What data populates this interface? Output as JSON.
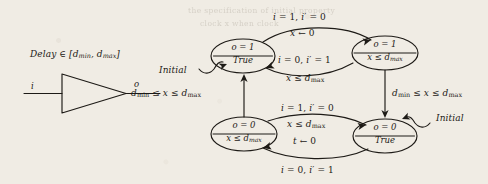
{
  "figure": {
    "background_color": "#f0ece4",
    "ink_color": "#1d1a16"
  },
  "gate": {
    "caption_prefix": "Delay",
    "caption_member": "∈",
    "caption_range": "[d",
    "caption_full": "Delay ∈ [dmin, dmax]",
    "delay_min": "min",
    "delay_max": "max",
    "input_label": "i",
    "output_label": "o",
    "symbol_name": "buffer-triangle"
  },
  "automaton": {
    "states": [
      {
        "id": "q1",
        "position": "top-left",
        "output_line": "o = 1",
        "invariant_line": "True",
        "is_initial": true,
        "initial_label": "Initial"
      },
      {
        "id": "q2",
        "position": "top-right",
        "output_line": "o = 1",
        "invariant_line": "x ≤ dmax",
        "invariant_base": "x ≤ d",
        "invariant_sub": "max",
        "is_initial": false,
        "initial_label": ""
      },
      {
        "id": "q3",
        "position": "bottom-left",
        "output_line": "o = 0",
        "invariant_line": "x ≤ dmax",
        "invariant_base": "x ≤ d",
        "invariant_sub": "max",
        "is_initial": false,
        "initial_label": ""
      },
      {
        "id": "q4",
        "position": "bottom-right",
        "output_line": "o = 0",
        "invariant_line": "True",
        "is_initial": true,
        "initial_label": "Initial"
      }
    ],
    "transitions": [
      {
        "id": "t-top",
        "from": "q1",
        "to": "q2",
        "guard": "i = 1, i′ = 0",
        "action": "x ← 0"
      },
      {
        "id": "t-top-back",
        "from": "q2",
        "to": "q1",
        "guard": "i = 0, i′ = 1",
        "action": "x ≤ dmax",
        "action_base": "x ≤ d",
        "action_sub": "max"
      },
      {
        "id": "t-bottom",
        "from": "q3",
        "to": "q4",
        "guard": "i = 1, i′ = 0",
        "action": "x ≤ dmax",
        "action_base": "x ≤ d",
        "action_sub": "max",
        "action2": "t ← 0"
      },
      {
        "id": "t-bottom-back",
        "from": "q4",
        "to": "q3",
        "guard": "i = 0, i′ = 1",
        "action": ""
      },
      {
        "id": "t-left-up",
        "from": "q3",
        "to": "q1",
        "guard": "dmin ≤ x ≤ dmax",
        "guard_p1": "d",
        "guard_s1": "min",
        "guard_p2": " ≤ x ≤ d",
        "guard_s2": "max"
      },
      {
        "id": "t-right-down",
        "from": "q2",
        "to": "q4",
        "guard": "dmin ≤ x ≤ dmax",
        "guard_p1": "d",
        "guard_s1": "min",
        "guard_p2": " ≤ x ≤ d",
        "guard_s2": "max"
      }
    ]
  },
  "bleed_text": {
    "lines": [
      "the specification of initial property",
      "clock x when clock"
    ]
  }
}
